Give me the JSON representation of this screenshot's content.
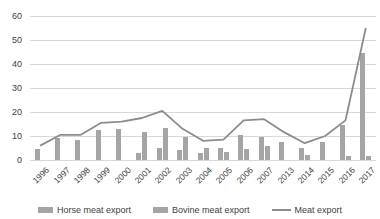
{
  "chart_data": {
    "type": "bar",
    "title": "",
    "xlabel": "",
    "ylabel": "",
    "categories": [
      "1996",
      "1997",
      "1998",
      "1999",
      "2000",
      "2001",
      "2002",
      "2003",
      "2004",
      "2005",
      "2006",
      "2007",
      "2013",
      "2014",
      "2015",
      "2016",
      "2017"
    ],
    "series": [
      {
        "name": "Horse meat export",
        "kind": "bar",
        "values": [
          4.5,
          9,
          8.5,
          12.5,
          13,
          3,
          5,
          4,
          3,
          5,
          10.5,
          9.5,
          7.5,
          5,
          7.5,
          14.5,
          44.5
        ]
      },
      {
        "name": "Bovine meat export",
        "kind": "bar",
        "values": [
          0,
          0,
          0,
          0,
          0,
          11.5,
          13.5,
          9.5,
          5,
          3.5,
          4.5,
          6,
          0,
          2,
          0,
          1.5,
          1.5
        ]
      },
      {
        "name": "Meat export",
        "kind": "line",
        "values": [
          6,
          10.5,
          10.5,
          15.5,
          16,
          17.5,
          20.5,
          13,
          8,
          8.5,
          16.5,
          17,
          11.5,
          7,
          10,
          16.5,
          55
        ]
      }
    ],
    "ylim": [
      0,
      60
    ],
    "y_ticks": [
      0,
      10,
      20,
      30,
      40,
      50,
      60
    ],
    "grid": true,
    "legend_position": "bottom"
  },
  "colors": {
    "horse_bar": "#a5a5a5",
    "bovine_bar": "#a5a5a5",
    "meat_line": "#8c8c8c",
    "gridline": "#d9d9d9",
    "axis_text": "#404040",
    "background": "#ffffff"
  }
}
